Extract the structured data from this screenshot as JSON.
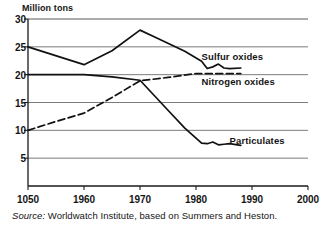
{
  "chart_data": {
    "type": "line",
    "title": "",
    "xlabel": "",
    "ylabel": "Million tons",
    "xlim": [
      1950,
      2000
    ],
    "ylim": [
      0,
      30
    ],
    "grid": true,
    "legend_position": "inline-annotations",
    "yticks": [
      30,
      25,
      20,
      15,
      10,
      5
    ],
    "xticks": [
      1950,
      1960,
      1970,
      1980,
      1990,
      2000
    ],
    "xtick_labels": [
      "1050",
      "1960",
      "1970",
      "1980",
      "1990",
      "2000"
    ],
    "ytick_labels": [
      "30",
      "25",
      "20",
      "15",
      "10",
      "5"
    ],
    "series": [
      {
        "name": "Sulfur oxides",
        "style": "solid",
        "color": "#111111",
        "x": [
          1950,
          1960,
          1965,
          1970,
          1973,
          1978,
          1981,
          1982,
          1983,
          1984,
          1985,
          1986,
          1988
        ],
        "values": [
          25.0,
          21.8,
          24.3,
          28.0,
          26.6,
          24.2,
          22.4,
          21.1,
          21.4,
          21.9,
          21.2,
          21.1,
          21.2
        ]
      },
      {
        "name": "Nitrogen oxides",
        "style": "dashed",
        "color": "#111111",
        "x": [
          1950,
          1955,
          1960,
          1965,
          1970,
          1975,
          1980,
          1983,
          1986,
          1988
        ],
        "values": [
          10.0,
          11.6,
          13.1,
          15.9,
          18.9,
          19.5,
          20.2,
          20.2,
          20.2,
          20.2
        ]
      },
      {
        "name": "Particulates",
        "style": "solid",
        "color": "#111111",
        "x": [
          1950,
          1960,
          1965,
          1970,
          1975,
          1978,
          1980,
          1981,
          1982,
          1983,
          1984,
          1985,
          1986,
          1988
        ],
        "values": [
          20.0,
          20.0,
          19.6,
          19.0,
          13.6,
          10.4,
          8.6,
          7.7,
          7.6,
          7.9,
          7.4,
          7.5,
          7.6,
          7.3
        ]
      }
    ],
    "annotations": [
      {
        "text": "Sulfur oxides",
        "x": 1981,
        "y": 23.2
      },
      {
        "text": "Nitrogen oxides",
        "x": 1981,
        "y": 18.6
      },
      {
        "text": "Particulates",
        "x": 1986,
        "y": 8.1
      }
    ],
    "source_prefix": "Source:",
    "source_text": "Worldwatch Institute, based on Summers and Heston."
  }
}
